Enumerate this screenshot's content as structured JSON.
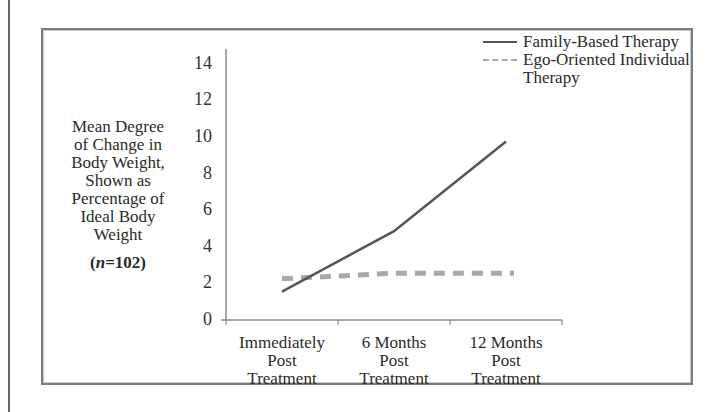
{
  "chart_data": {
    "type": "line",
    "title": "",
    "ylabel": "Mean Degree of Change in Body Weight, Shown as Percentage of Ideal Body Weight",
    "ylabel_lines": [
      "Mean Degree",
      "of Change in",
      "Body Weight,",
      "Shown as",
      "Percentage of",
      "Ideal Body",
      "Weight"
    ],
    "sample_size_label": "(n=102)",
    "sample_size_prefix": "(",
    "sample_size_var": "n",
    "sample_size_value": "=102)",
    "xlabel": "",
    "categories": [
      "Immediately Post Treatment",
      "6 Months Post Treatment",
      "12 Months Post Treatment"
    ],
    "category_lines": [
      [
        "Immediately",
        "Post",
        "Treatment"
      ],
      [
        "6 Months",
        "Post",
        "Treatment"
      ],
      [
        "12 Months",
        "Post",
        "Treatment"
      ]
    ],
    "yticks": [
      0,
      2,
      4,
      6,
      8,
      10,
      12,
      14
    ],
    "ylim": [
      0,
      14.8
    ],
    "grid": false,
    "legend_position": "top-right",
    "series": [
      {
        "name": "Family-Based Therapy",
        "style": "solid",
        "color": "#555555",
        "values": [
          1.5,
          4.8,
          9.7
        ]
      },
      {
        "name": "Ego-Oriented Individual Therapy",
        "style": "dashed",
        "color": "#a8a8a8",
        "values": [
          2.2,
          2.5,
          2.5
        ]
      }
    ]
  },
  "legend": {
    "items": [
      {
        "label": "Family-Based Therapy"
      },
      {
        "label": "Ego-Oriented Individual\nTherapy"
      }
    ]
  }
}
